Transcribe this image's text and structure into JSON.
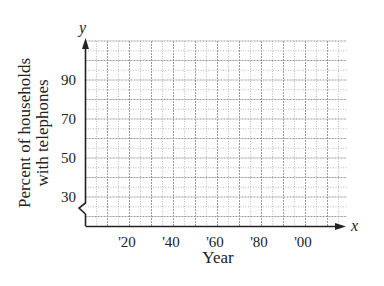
{
  "chart_data": {
    "type": "line",
    "title": "",
    "xlabel": "Year",
    "ylabel": "Percent of households with telephones",
    "ylabel_lines": [
      "Percent of households",
      "with telephones"
    ],
    "x_axis_var": "x",
    "y_axis_var": "y",
    "x_tick_labels": [
      "'20",
      "'40",
      "'60",
      "'80",
      "'00"
    ],
    "x_tick_values": [
      1920,
      1940,
      1960,
      1980,
      2000
    ],
    "y_tick_labels": [
      "90",
      "70",
      "50",
      "30"
    ],
    "y_tick_values": [
      90,
      70,
      50,
      30
    ],
    "xlim": [
      1900,
      2012
    ],
    "ylim": [
      25,
      105
    ],
    "y_axis_break": true,
    "grid": true,
    "series": [],
    "legend": null
  }
}
